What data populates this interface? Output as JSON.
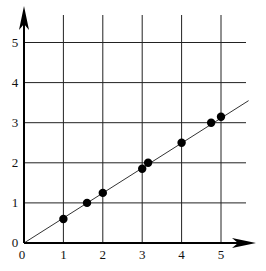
{
  "chart_data": {
    "type": "scatter",
    "title": "",
    "xlabel": "",
    "ylabel": "",
    "xlim": [
      0,
      5.8
    ],
    "ylim": [
      0,
      6.2
    ],
    "grid": true,
    "x_ticks": [
      "0",
      "1",
      "2",
      "3",
      "4",
      "5"
    ],
    "y_ticks": [
      "0",
      "1",
      "2",
      "3",
      "4",
      "5"
    ],
    "points": [
      {
        "x": 1.0,
        "y": 0.6
      },
      {
        "x": 1.6,
        "y": 1.0
      },
      {
        "x": 2.0,
        "y": 1.25
      },
      {
        "x": 3.0,
        "y": 1.85
      },
      {
        "x": 3.15,
        "y": 2.0
      },
      {
        "x": 4.0,
        "y": 2.5
      },
      {
        "x": 4.75,
        "y": 3.0
      },
      {
        "x": 5.0,
        "y": 3.15
      }
    ],
    "fit_line": {
      "x0": 0,
      "y0": 0,
      "x1": 5.7,
      "y1": 3.55
    }
  }
}
